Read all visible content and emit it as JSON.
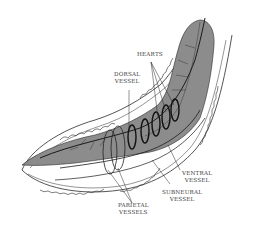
{
  "diagram": {
    "colors": {
      "background": "#ffffff",
      "gut": "#8c8c8c",
      "outline": "#2a2a2a",
      "label": "#3a3a3a"
    },
    "labels": {
      "hearts": "HEARTS",
      "dorsal_vessel_1": "DORSAL",
      "dorsal_vessel_2": "VESSEL",
      "ventral_vessel_1": "VENTRAL",
      "ventral_vessel_2": "VESSEL",
      "subneural_vessel_1": "SUBNEURAL",
      "subneural_vessel_2": "VESSEL",
      "parietal_vessels_1": "PARIETAL",
      "parietal_vessels_2": "VESSELS"
    }
  }
}
